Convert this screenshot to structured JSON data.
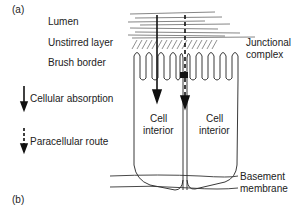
{
  "panel_labels": {
    "a": "(a)",
    "b": "(b)"
  },
  "layers": {
    "lumen": "Lumen",
    "unstirred": "Unstirred layer",
    "brush": "Brush border"
  },
  "legend": {
    "cellular": "Cellular absorption",
    "paracellular": "Paracellular route"
  },
  "annotations": {
    "junctional_1": "Junctional",
    "junctional_2": "complex",
    "cell_left_1": "Cell",
    "cell_left_2": "interior",
    "cell_right_1": "Cell",
    "cell_right_2": "interior",
    "basement_1": "Basement",
    "basement_2": "membrane"
  }
}
